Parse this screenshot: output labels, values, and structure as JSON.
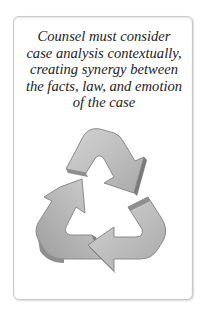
{
  "card": {
    "caption_lines": [
      "Counsel must consider",
      "case analysis contextually,",
      "creating synergy between",
      "the facts, law, and emotion",
      "of the case"
    ],
    "illustration": {
      "icon": "recycle-icon",
      "colors": {
        "face": "#bdbdbd",
        "side": "#8e8e8e",
        "shadow": "#6f6f6f"
      }
    }
  }
}
